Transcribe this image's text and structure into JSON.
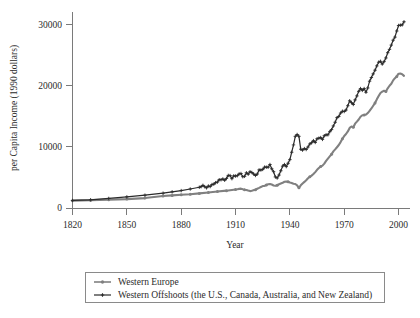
{
  "chart_data": {
    "type": "line",
    "title": "",
    "xlabel": "Year",
    "ylabel": "per Capita Income (1990 dollars)",
    "xlim": [
      1820,
      2003
    ],
    "ylim": [
      0,
      32000
    ],
    "xticks": [
      1820,
      1850,
      1880,
      1910,
      1940,
      1970,
      2000
    ],
    "yticks": [
      0,
      10000,
      20000,
      30000
    ],
    "grid": false,
    "legend_position": "below-plot",
    "colors": {
      "western_europe": "#808080",
      "western_offshoots": "#2b2b2b",
      "axis": "#7a7a7a",
      "text": "#2b2b2b"
    },
    "series": [
      {
        "name": "Western Europe",
        "marker": "circle",
        "color": "#808080",
        "x": [
          1820,
          1830,
          1840,
          1850,
          1860,
          1870,
          1875,
          1880,
          1885,
          1890,
          1895,
          1900,
          1905,
          1910,
          1911,
          1912,
          1913,
          1914,
          1915,
          1916,
          1917,
          1918,
          1919,
          1920,
          1921,
          1922,
          1923,
          1924,
          1925,
          1926,
          1927,
          1928,
          1929,
          1930,
          1931,
          1932,
          1933,
          1934,
          1935,
          1936,
          1937,
          1938,
          1939,
          1940,
          1941,
          1942,
          1943,
          1944,
          1945,
          1946,
          1947,
          1948,
          1949,
          1950,
          1951,
          1952,
          1953,
          1954,
          1955,
          1956,
          1957,
          1958,
          1959,
          1960,
          1961,
          1962,
          1963,
          1964,
          1965,
          1966,
          1967,
          1968,
          1969,
          1970,
          1971,
          1972,
          1973,
          1974,
          1975,
          1976,
          1977,
          1978,
          1979,
          1980,
          1981,
          1982,
          1983,
          1984,
          1985,
          1986,
          1987,
          1988,
          1989,
          1990,
          1991,
          1992,
          1993,
          1994,
          1995,
          1996,
          1997,
          1998,
          1999,
          2000,
          2001,
          2002,
          2003
        ],
        "y": [
          1202,
          1280,
          1360,
          1450,
          1620,
          1960,
          2060,
          2160,
          2250,
          2380,
          2520,
          2690,
          2830,
          3020,
          3060,
          3120,
          3160,
          3060,
          2980,
          2950,
          2850,
          2760,
          2810,
          2920,
          2980,
          3140,
          3280,
          3430,
          3580,
          3600,
          3760,
          3870,
          3930,
          3830,
          3680,
          3620,
          3720,
          3870,
          3990,
          4110,
          4280,
          4320,
          4280,
          4150,
          4080,
          3960,
          3920,
          3700,
          3300,
          3700,
          4000,
          4260,
          4540,
          4860,
          5100,
          5290,
          5550,
          5860,
          6230,
          6520,
          6780,
          6920,
          7240,
          7690,
          8070,
          8430,
          8770,
          9240,
          9570,
          9920,
          10280,
          10760,
          11290,
          11760,
          12080,
          12500,
          13070,
          13300,
          13200,
          13770,
          14100,
          14450,
          14900,
          15140,
          15180,
          15250,
          15500,
          15870,
          16250,
          16690,
          17130,
          17740,
          18280,
          18780,
          19000,
          19150,
          19020,
          19540,
          19960,
          20270,
          20840,
          21200,
          21480,
          21930,
          21950,
          21850,
          21570
        ]
      },
      {
        "name": "Western Offshoots (the U.S., Canada, Australia, and New Zealand)",
        "marker": "plus",
        "color": "#2b2b2b",
        "x": [
          1820,
          1830,
          1840,
          1850,
          1860,
          1870,
          1875,
          1880,
          1885,
          1890,
          1891,
          1892,
          1893,
          1894,
          1895,
          1896,
          1897,
          1898,
          1899,
          1900,
          1901,
          1902,
          1903,
          1904,
          1905,
          1906,
          1907,
          1908,
          1909,
          1910,
          1911,
          1912,
          1913,
          1914,
          1915,
          1916,
          1917,
          1918,
          1919,
          1920,
          1921,
          1922,
          1923,
          1924,
          1925,
          1926,
          1927,
          1928,
          1929,
          1930,
          1931,
          1932,
          1933,
          1934,
          1935,
          1936,
          1937,
          1938,
          1939,
          1940,
          1941,
          1942,
          1943,
          1944,
          1945,
          1946,
          1947,
          1948,
          1949,
          1950,
          1951,
          1952,
          1953,
          1954,
          1955,
          1956,
          1957,
          1958,
          1959,
          1960,
          1961,
          1962,
          1963,
          1964,
          1965,
          1966,
          1967,
          1968,
          1969,
          1970,
          1971,
          1972,
          1973,
          1974,
          1975,
          1976,
          1977,
          1978,
          1979,
          1980,
          1981,
          1982,
          1983,
          1984,
          1985,
          1986,
          1987,
          1988,
          1989,
          1990,
          1991,
          1992,
          1993,
          1994,
          1995,
          1996,
          1997,
          1998,
          1999,
          2000,
          2001,
          2002,
          2003
        ],
        "y": [
          1231,
          1340,
          1560,
          1810,
          2090,
          2420,
          2630,
          2840,
          3100,
          3390,
          3480,
          3700,
          3470,
          3290,
          3590,
          3500,
          3830,
          3890,
          4140,
          4230,
          4620,
          4610,
          4740,
          4530,
          4830,
          5320,
          5290,
          4790,
          5240,
          5220,
          5280,
          5570,
          5630,
          5110,
          5170,
          5750,
          5520,
          5920,
          5800,
          5550,
          5310,
          5550,
          6220,
          6200,
          6300,
          6670,
          6660,
          6660,
          7100,
          6400,
          5930,
          5070,
          4900,
          5380,
          6080,
          6830,
          7100,
          6760,
          7300,
          7900,
          9100,
          10300,
          11700,
          12000,
          11700,
          9600,
          9450,
          9700,
          9550,
          9960,
          10450,
          10650,
          11000,
          10700,
          11300,
          11400,
          11500,
          11200,
          11800,
          11950,
          11950,
          12450,
          12800,
          13400,
          14000,
          14750,
          14950,
          15500,
          15800,
          15750,
          16000,
          16700,
          17500,
          17200,
          16900,
          17650,
          18300,
          19050,
          19500,
          19200,
          19500,
          18900,
          19600,
          20700,
          21300,
          21900,
          22500,
          23200,
          23800,
          23950,
          23500,
          23900,
          24500,
          25350,
          25900,
          26600,
          27400,
          27900,
          28900,
          29800,
          29850,
          29900,
          30400
        ]
      }
    ]
  },
  "legend": {
    "entries": [
      {
        "label": "Western Europe"
      },
      {
        "label": "Western Offshoots (the U.S., Canada, Australia, and New Zealand)"
      }
    ]
  }
}
